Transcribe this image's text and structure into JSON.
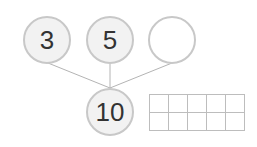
{
  "diagram": {
    "top_circles": [
      {
        "label": "3",
        "filled": true
      },
      {
        "label": "5",
        "filled": true
      },
      {
        "label": "",
        "filled": false
      }
    ],
    "bottom_circle": {
      "label": "10",
      "filled": true
    },
    "ten_frame": {
      "rows": 2,
      "cols": 5,
      "filled_cells": 0
    }
  },
  "colors": {
    "circle_fill": "#f2f2f2",
    "circle_stroke": "#c8c8c8",
    "line": "#b4b4b4",
    "grid": "#bdbdbd",
    "text": "#333333"
  }
}
